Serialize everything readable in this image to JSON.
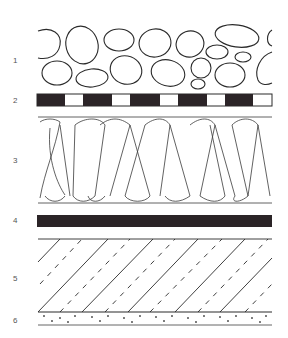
{
  "diagram": {
    "type": "layer-cross-section",
    "layers": [
      {
        "number": "1",
        "name": "gravel-layer",
        "label_y": 60
      },
      {
        "number": "2",
        "name": "membrane-layer",
        "label_y": 100
      },
      {
        "number": "3",
        "name": "insulation-layer",
        "label_y": 160
      },
      {
        "number": "4",
        "name": "vapour-barrier-layer",
        "label_y": 220
      },
      {
        "number": "5",
        "name": "deck-layer",
        "label_y": 278
      },
      {
        "number": "6",
        "name": "ceiling-layer",
        "label_y": 320
      }
    ],
    "colors": {
      "stroke": "#2a2a2a",
      "fill_dark": "#2b2427",
      "background": "#ffffff",
      "label": "#555555"
    }
  }
}
